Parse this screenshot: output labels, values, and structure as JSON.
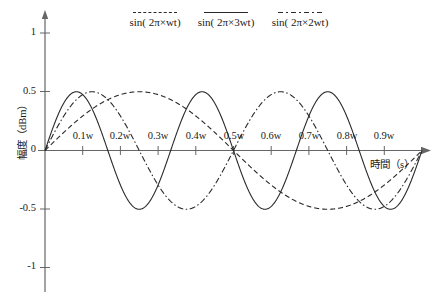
{
  "chart_data": {
    "type": "line",
    "title": "",
    "xlabel": "時間（s）",
    "ylabel": "幅度（dBm）",
    "xlim": [
      0,
      1.0
    ],
    "ylim": [
      -1.25,
      1.25
    ],
    "grid": false,
    "legend_position": "top",
    "x_tick_labels": [
      "0.1w",
      "0.2w",
      "0.3w",
      "0.4w",
      "0.5w",
      "0.6w",
      "0.7w",
      "0.8w",
      "0.9w"
    ],
    "x_tick_values": [
      0.1,
      0.2,
      0.3,
      0.4,
      0.5,
      0.6,
      0.7,
      0.8,
      0.9
    ],
    "y_tick_labels": [
      "1",
      "0.5",
      "0",
      "-0.5",
      "-1"
    ],
    "y_tick_values": [
      1,
      0.5,
      0,
      -0.5,
      -1
    ],
    "series": [
      {
        "name": "sin( 2π×wt)",
        "style": "dashed",
        "color": "#2a2a2a",
        "frequency_multiplier": 1,
        "amplitude": 1,
        "x": [
          0,
          0.05,
          0.1,
          0.15,
          0.2,
          0.25,
          0.3,
          0.35,
          0.4,
          0.45,
          0.5,
          0.55,
          0.6,
          0.65,
          0.7,
          0.75,
          0.8,
          0.85,
          0.9,
          0.95,
          1.0
        ],
        "values": [
          0,
          0.309,
          0.588,
          0.809,
          0.951,
          1.0,
          0.951,
          0.809,
          0.588,
          0.309,
          0,
          -0.309,
          -0.588,
          -0.809,
          -0.951,
          -1.0,
          -0.951,
          -0.809,
          -0.588,
          -0.309,
          0
        ]
      },
      {
        "name": "sin( 2π×3wt)",
        "style": "solid",
        "color": "#2a2a2a",
        "frequency_multiplier": 3,
        "amplitude": 1,
        "x": [
          0,
          0.0417,
          0.0833,
          0.125,
          0.1667,
          0.2083,
          0.25,
          0.2917,
          0.3333,
          0.375,
          0.4167,
          0.4583,
          0.5,
          0.5417,
          0.5833,
          0.625,
          0.6667,
          0.7083,
          0.75,
          0.7917,
          0.8333,
          0.875,
          0.9167,
          0.9583,
          1.0
        ],
        "values": [
          0,
          1.0,
          0,
          -1.0,
          0,
          1.0,
          0,
          -1.0,
          0,
          1.0,
          0,
          -1.0,
          0,
          1.0,
          0,
          -1.0,
          0,
          1.0,
          0,
          -1.0,
          0,
          1.0,
          0,
          -1.0,
          0
        ]
      },
      {
        "name": "sin( 2π×2wt)",
        "style": "dashdot",
        "color": "#2a2a2a",
        "frequency_multiplier": 2,
        "amplitude": 1,
        "x": [
          0,
          0.0625,
          0.125,
          0.1875,
          0.25,
          0.3125,
          0.375,
          0.4375,
          0.5,
          0.5625,
          0.625,
          0.6875,
          0.75,
          0.8125,
          0.875,
          0.9375,
          1.0
        ],
        "values": [
          0,
          1.0,
          0,
          -1.0,
          0,
          1.0,
          0,
          -1.0,
          0,
          1.0,
          0,
          -1.0,
          0,
          1.0,
          0,
          -1.0,
          0
        ]
      }
    ]
  },
  "legend": [
    {
      "label": "sin( 2π×wt)",
      "style": "dashed"
    },
    {
      "label": "sin( 2π×3wt)",
      "style": "solid"
    },
    {
      "label": "sin( 2π×2wt)",
      "style": "dashdot"
    }
  ],
  "axes": {
    "x_title": "時間（s）",
    "y_title": "幅度（dBm）"
  },
  "colors": {
    "line": "#2a2a2a",
    "axis": "#555555",
    "text": "#1a1a1a",
    "background": "#ffffff"
  }
}
